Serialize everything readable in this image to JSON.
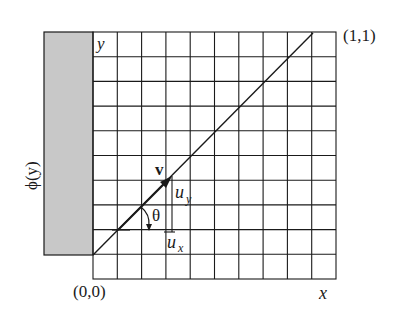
{
  "figure": {
    "labels": {
      "y_axis": "y",
      "x_axis": "x",
      "origin": "(0,0)",
      "corner": "(1,1)",
      "phi": "ϕ(y)",
      "vector": "v",
      "uy": "u",
      "uy_sub": "y",
      "ux": "u",
      "ux_sub": "x",
      "theta": "θ"
    },
    "grid": {
      "columns": 10,
      "rows": 10
    },
    "colors": {
      "line": "#1a1a1a",
      "shaded_region": "#c8c8c8",
      "background": "#ffffff"
    }
  }
}
